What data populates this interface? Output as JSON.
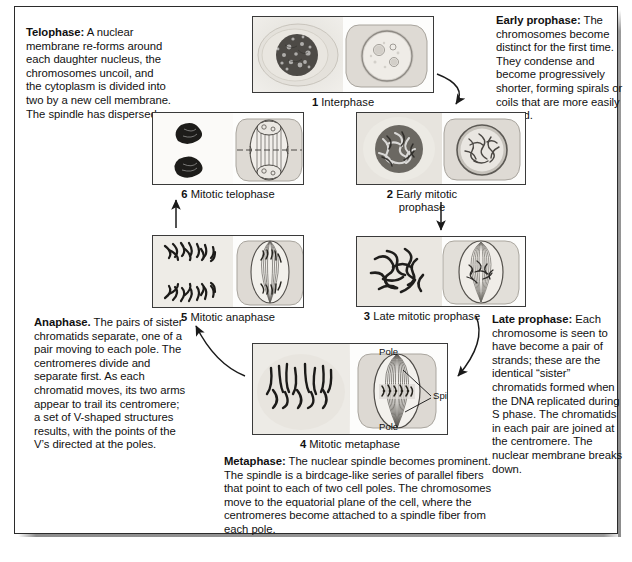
{
  "figure": {
    "border_color": "#2b2b2b"
  },
  "descriptions": {
    "telophase": {
      "term": "Telophase:",
      "body": " A nuclear membrane re-forms around each daughter nucleus, the chromosomes uncoil, and the cytoplasm is divided into two by a new cell membrane. The spindle has dispersed."
    },
    "early_prophase": {
      "term": "Early prophase:",
      "body": " The chromosomes become distinct for the first time. They condense and become progressively shorter, forming spirals or coils that are more easily moved."
    },
    "late_prophase": {
      "term": "Late prophase:",
      "body": " Each chromosome is seen to have become a pair of strands; these are the identical “sister” chromatids formed when the DNA replicated during S phase. The chromatids in each pair are joined at the centromere. The nuclear membrane breaks down."
    },
    "anaphase": {
      "term": "Anaphase.",
      "body": " The pairs of sister chromatids separate, one of a pair moving to each pole. The centromeres divide and separate first. As each chromatid moves, its two arms appear to trail its centromere; a set of V-shaped structures results, with the points of the V’s directed at the poles."
    },
    "metaphase": {
      "term": "Metaphase:",
      "body": " The nuclear spindle becomes prominent. The spindle is a birdcage-like series of parallel fibers that point to each of two cell poles. The chromosomes move to the equatorial plane of the cell, where the centromeres become attached to a spindle fiber from each pole."
    }
  },
  "panels": [
    {
      "number": "1",
      "label": "Interphase",
      "caption": "1 Interphase"
    },
    {
      "number": "2",
      "label": "Early mitotic prophase",
      "caption": "2 Early mitotic prophase"
    },
    {
      "number": "3",
      "label": "Late mitotic prophase",
      "caption": "3 Late mitotic prophase"
    },
    {
      "number": "4",
      "label": "Mitotic metaphase",
      "caption": "4 Mitotic metaphase"
    },
    {
      "number": "5",
      "label": "Mitotic anaphase",
      "caption": "5 Mitotic anaphase"
    },
    {
      "number": "6",
      "label": "Mitotic telophase",
      "caption": "6 Mitotic telophase"
    }
  ],
  "panel_labels": {
    "pole_top": "Pole",
    "pole_bottom": "Pole",
    "spindle": "Spindle"
  },
  "flow": {
    "sequence": [
      "1",
      "2",
      "3",
      "4",
      "5",
      "6"
    ],
    "direction": "counterclockwise",
    "arrow_color": "#1a1a1a"
  }
}
